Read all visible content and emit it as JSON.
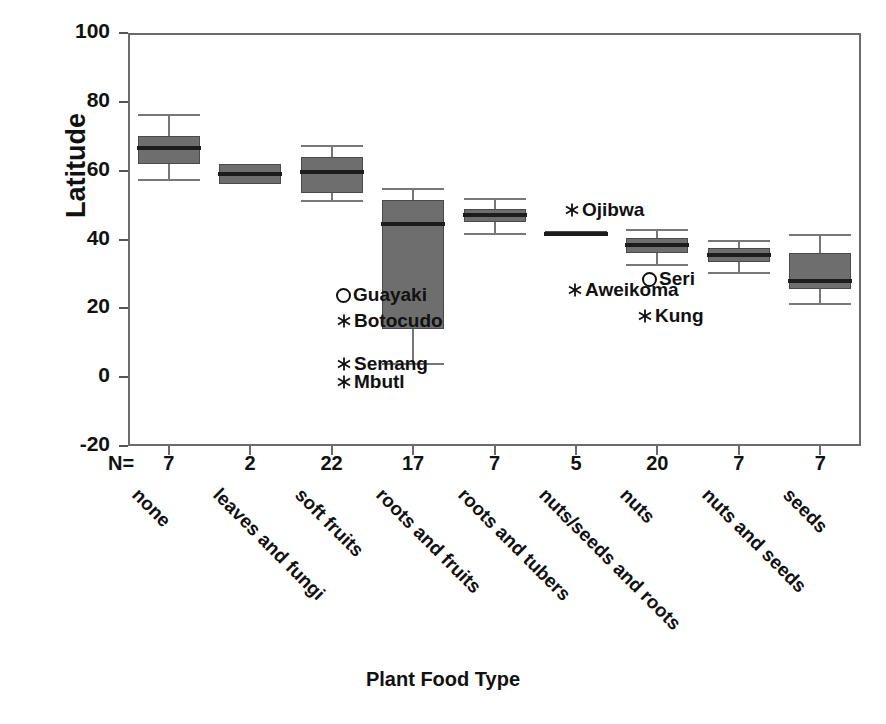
{
  "chart_data": {
    "type": "box",
    "title": "",
    "xlabel": "Plant Food Type",
    "ylabel": "Latitude",
    "ylim": [
      -20,
      100
    ],
    "yticks": [
      100,
      80,
      60,
      40,
      20,
      0,
      -20
    ],
    "grid": false,
    "legend": "none",
    "n_header": "N=",
    "categories": [
      "none",
      "leaves and fungi",
      "soft fruits",
      "roots and fruits",
      "roots and tubers",
      "nuts/seeds and roots",
      "nuts",
      "nuts and seeds",
      "seeds"
    ],
    "n_values": [
      7,
      2,
      22,
      17,
      7,
      5,
      20,
      7,
      7
    ],
    "boxes": [
      {
        "category": "none",
        "whisker_low": 57.5,
        "q1": 62.0,
        "median": 66.5,
        "q3": 70.0,
        "whisker_high": 76.5
      },
      {
        "category": "leaves and fungi",
        "whisker_low": 56.0,
        "q1": 56.0,
        "median": 59.0,
        "q3": 62.0,
        "whisker_high": 62.0
      },
      {
        "category": "soft fruits",
        "whisker_low": 51.5,
        "q1": 53.5,
        "median": 59.5,
        "q3": 64.0,
        "whisker_high": 67.5
      },
      {
        "category": "roots and fruits",
        "whisker_low": 4.0,
        "q1": 14.0,
        "median": 44.5,
        "q3": 51.5,
        "whisker_high": 55.0
      },
      {
        "category": "roots and tubers",
        "whisker_low": 42.0,
        "q1": 45.0,
        "median": 47.0,
        "q3": 49.0,
        "whisker_high": 52.0
      },
      {
        "category": "nuts/seeds and roots",
        "whisker_low": 41.0,
        "q1": 41.0,
        "median": 41.5,
        "q3": 42.5,
        "whisker_high": 42.5
      },
      {
        "category": "nuts",
        "whisker_low": 33.0,
        "q1": 36.0,
        "median": 38.5,
        "q3": 40.5,
        "whisker_high": 43.0
      },
      {
        "category": "nuts and seeds",
        "whisker_low": 30.5,
        "q1": 33.5,
        "median": 35.5,
        "q3": 37.5,
        "whisker_high": 40.0
      },
      {
        "category": "seeds",
        "whisker_low": 21.5,
        "q1": 25.5,
        "median": 28.0,
        "q3": 36.0,
        "whisker_high": 41.5
      }
    ],
    "outliers": [
      {
        "label": "Guayaki",
        "marker": "circle-marker",
        "category": "roots and fruits",
        "value": 27.0,
        "label_x": 336,
        "label_y": 284
      },
      {
        "label": "Botocudo",
        "marker": "star-marker",
        "category": "roots and fruits",
        "value": 21.0,
        "label_x": 336,
        "label_y": 310
      },
      {
        "label": "Semang",
        "marker": "star-marker",
        "category": "roots and fruits",
        "value": 5.5,
        "label_x": 336,
        "label_y": 353
      },
      {
        "label": "Mbutl",
        "marker": "star-marker",
        "category": "roots and fruits",
        "value": 2.0,
        "label_x": 336,
        "label_y": 371
      },
      {
        "label": "Ojibwa",
        "marker": "star-marker",
        "category": "nuts/seeds and roots",
        "value": 52.0,
        "label_x": 564,
        "label_y": 199
      },
      {
        "label": "Aweikoma",
        "marker": "star-marker",
        "category": "nuts",
        "value": 28.0,
        "label_x": 567,
        "label_y": 279
      },
      {
        "label": "Seri",
        "marker": "circle-marker",
        "category": "nuts",
        "value": 29.0,
        "label_x": 642,
        "label_y": 268
      },
      {
        "label": "Kung",
        "marker": "star-marker",
        "category": "nuts",
        "value": 19.5,
        "label_x": 637,
        "label_y": 305
      }
    ]
  },
  "colors": {
    "box_fill": "#6e6e6e",
    "box_edge": "#4a4a4a",
    "median": "#1c1c1c",
    "axis": "#6b6b6b",
    "text": "#111111",
    "background": "#ffffff"
  }
}
